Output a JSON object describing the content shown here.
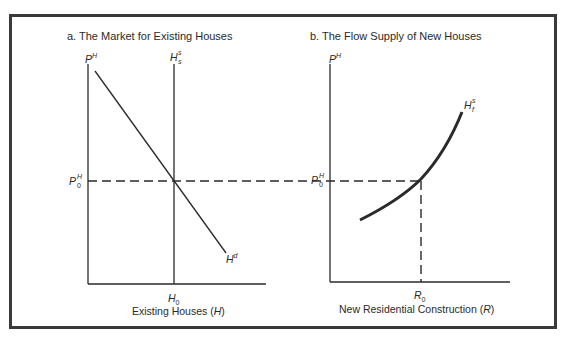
{
  "panel_a": {
    "title": "a.  The Market for Existing Houses",
    "y_axis_label": {
      "base": "P",
      "sup": "H"
    },
    "supply_label": {
      "base": "H",
      "sup": "s",
      "sub": "s"
    },
    "demand_label": {
      "base": "H",
      "sup": "d"
    },
    "price_label": {
      "base": "P",
      "sup": "H",
      "sub": "0"
    },
    "x_tick_label": {
      "base": "H",
      "sub": "0"
    },
    "x_axis_title": {
      "text": "Existing Houses (",
      "var": "H",
      "close": ")"
    }
  },
  "panel_b": {
    "title": "b.  The Flow Supply of New Houses",
    "y_axis_label": {
      "base": "P",
      "sup": "H"
    },
    "supply_label": {
      "base": "H",
      "sup": "s",
      "sub": "f"
    },
    "price_label": {
      "base": "P",
      "sup": "H",
      "sub": "0"
    },
    "x_tick_label": {
      "base": "R",
      "sub": "0"
    },
    "x_axis_title": {
      "text": "New Residential Construction (",
      "var": "R",
      "close": ")"
    }
  },
  "colors": {
    "ink": "#2a2a2a",
    "frame": "#3a3a3a",
    "background": "#ffffff"
  }
}
